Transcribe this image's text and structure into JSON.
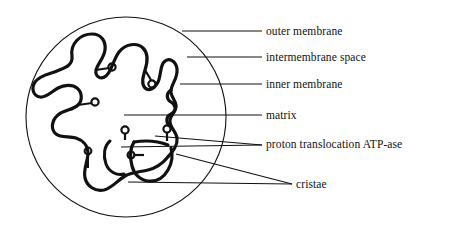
{
  "figure": {
    "stroke_color": "#111111",
    "background_color": "#ffffff",
    "outer_membrane_circle": {
      "cx": 126,
      "cy": 117,
      "r": 100
    }
  },
  "labels": [
    {
      "id": "outer-membrane",
      "text": "outer membrane"
    },
    {
      "id": "intermembrane-space",
      "text": "intermembrane space"
    },
    {
      "id": "inner-membrane",
      "text": "inner membrane"
    },
    {
      "id": "matrix",
      "text": "matrix"
    },
    {
      "id": "atpase",
      "text": "proton translocation ATP-ase"
    },
    {
      "id": "cristae",
      "text": "cristae"
    }
  ]
}
